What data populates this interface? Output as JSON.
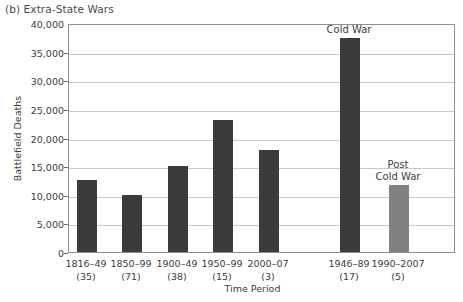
{
  "chart_data": {
    "type": "bar",
    "title": "(b) Extra-State Wars",
    "xlabel": "Time Period",
    "ylabel": "Battlefield Deaths",
    "ylim": [
      0,
      40000
    ],
    "ytick_values": [
      0,
      5000,
      10000,
      15000,
      20000,
      25000,
      30000,
      35000,
      40000
    ],
    "ytick_labels": [
      "0",
      "5,000",
      "10,000",
      "15,000",
      "20,000",
      "25,000",
      "30,000",
      "35,000",
      "40,000"
    ],
    "grid": true,
    "legend": "none",
    "categories": [
      "1816–49",
      "1850–99",
      "1900–49",
      "1950–99",
      "2000–07",
      "1946–89",
      "1990–2007"
    ],
    "category_counts": [
      "(35)",
      "(71)",
      "(38)",
      "(15)",
      "(3)",
      "(17)",
      "(5)"
    ],
    "values": [
      12500,
      10000,
      15000,
      23000,
      17800,
      37300,
      11700
    ],
    "bar_colors": [
      "#3b3b3b",
      "#3b3b3b",
      "#3b3b3b",
      "#3b3b3b",
      "#3b3b3b",
      "#3b3b3b",
      "#818181"
    ],
    "annotations": [
      {
        "text": "Cold War",
        "series_index": 5
      },
      {
        "text": "Post\nCold War",
        "series_index": 6
      }
    ]
  },
  "annotation_cold_war": "Cold War",
  "annotation_post_cold_war_line1": "Post",
  "annotation_post_cold_war_line2": "Cold War",
  "colors": {
    "bar_dark": "#3b3b3b",
    "bar_gray": "#818181",
    "gridline": "#c9c9c9",
    "frame": "#8f8f8f",
    "text": "#3c3c3c"
  }
}
